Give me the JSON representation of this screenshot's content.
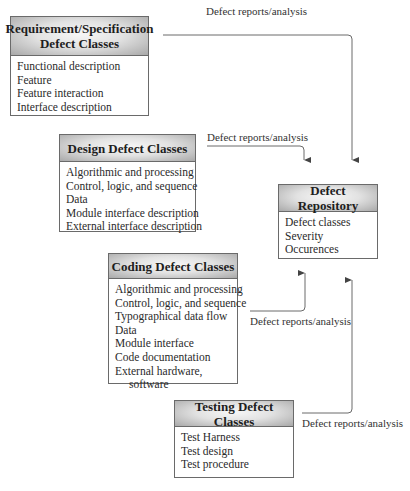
{
  "boxes": {
    "requirement": {
      "title_line1": "Requirement/Specification",
      "title_line2": "Defect Classes",
      "items": [
        "Functional description",
        "Feature",
        "Feature interaction",
        "Interface description"
      ]
    },
    "design": {
      "title": "Design Defect Classes",
      "items": [
        "Algorithmic and processing",
        "Control, logic, and sequence",
        "Data",
        "Module interface description",
        "External interface description"
      ]
    },
    "coding": {
      "title": "Coding Defect Classes",
      "items": [
        "Algorithmic and processing",
        "Control, logic, and sequence",
        "Typographical data flow",
        "Data",
        "Module interface",
        "Code documentation",
        "External hardware,",
        "software"
      ]
    },
    "testing": {
      "title": "Testing Defect Classes",
      "items": [
        "Test Harness",
        "Test design",
        "Test procedure"
      ]
    },
    "repository": {
      "title": "Defect Repository",
      "items": [
        "Defect classes",
        "Severity",
        "Occurences"
      ]
    }
  },
  "arrows": {
    "requirement_label": "Defect reports/analysis",
    "design_label": "Defect reports/analysis",
    "coding_label": "Defect reports/analysis",
    "testing_label": "Defect reports/analysis"
  },
  "colors": {
    "line": "#6a6a6a",
    "header_light": "#f7f7f7",
    "header_dark": "#a9a9a9"
  }
}
